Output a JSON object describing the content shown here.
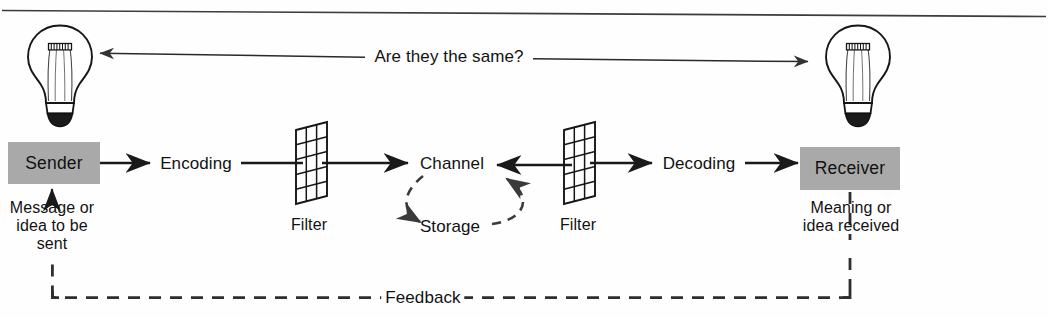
{
  "diagram": {
    "colors": {
      "ink": "#121212",
      "box_fill": "#a9a9a9",
      "line": "#1a1a1a",
      "paper": "#fefefe"
    },
    "top_question": "Are they the same?",
    "nodes": {
      "sender": "Sender",
      "receiver": "Receiver",
      "encoding": "Encoding",
      "decoding": "Decoding",
      "channel": "Channel",
      "storage": "Storage",
      "filter_left": "Filter",
      "filter_right": "Filter",
      "feedback": "Feedback"
    },
    "annotations": {
      "sender_note_line1": "Message or",
      "sender_note_line2": "idea to be",
      "sender_note_line3": "sent",
      "receiver_note_line1": "Meaning or",
      "receiver_note_line2": "idea received"
    },
    "icons": {
      "bulb_left": "lightbulb-icon",
      "bulb_right": "lightbulb-icon",
      "filter_left": "filter-grid-icon",
      "filter_right": "filter-grid-icon"
    },
    "flow_sequence": [
      "Sender",
      "Encoding",
      "Filter",
      "Channel",
      "Filter",
      "Decoding",
      "Receiver"
    ],
    "loop": {
      "from": "Channel",
      "to": "Storage",
      "style": "dashed-cycle",
      "bidirectional": true
    },
    "feedback_path": {
      "from": "Receiver",
      "to": "Sender",
      "style": "dashed",
      "label": "Feedback"
    }
  }
}
